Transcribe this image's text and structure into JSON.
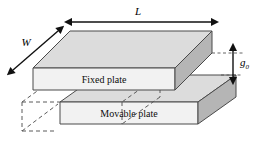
{
  "figure": {
    "background_color": "#ffffff"
  },
  "dimensions": {
    "length_label": "L",
    "width_label": "W",
    "gap_label": "g",
    "gap_subscript": "0"
  },
  "plates": {
    "fixed": {
      "label": "Fixed plate"
    },
    "movable": {
      "label": "Movable plate"
    }
  },
  "colors": {
    "top_face": "#dcdcdc",
    "front_face": "#f2f2f2",
    "side_face": "#b5b5b5",
    "edge": "#4a4a4a",
    "hidden_edge": "#5a5a5a",
    "arrow": "#111111",
    "text": "#000000"
  },
  "icons": {
    "length_arrow": "double-headed-horizontal-arrow",
    "width_arrow": "double-headed-diagonal-arrow",
    "gap_arrow": "double-headed-vertical-arrow"
  }
}
